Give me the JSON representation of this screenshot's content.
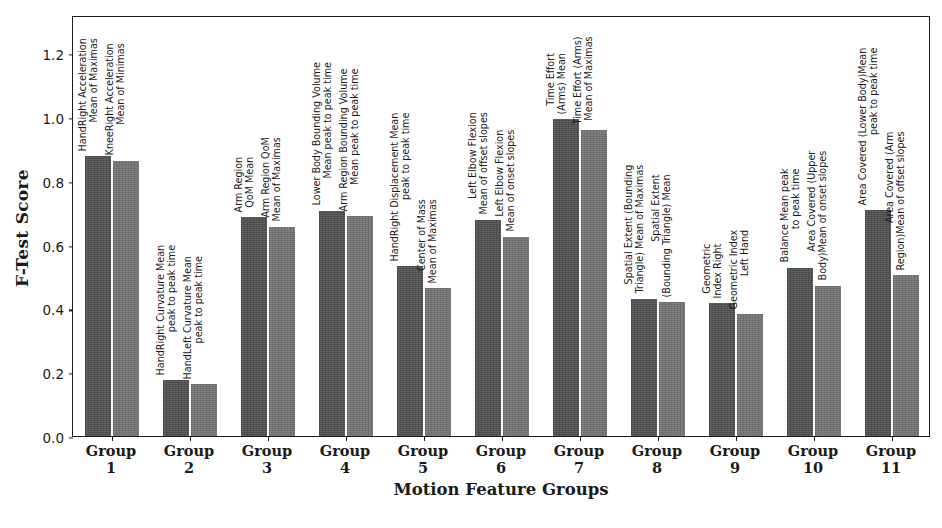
{
  "chart_data": {
    "type": "bar",
    "title": "",
    "xlabel": "Motion Feature Groups",
    "ylabel": "F-Test Score",
    "ylim": [
      0.0,
      1.32
    ],
    "yticks": [
      "0.0",
      "0.2",
      "0.4",
      "0.6",
      "0.8",
      "1.0",
      "1.2"
    ],
    "ytick_values": [
      0.0,
      0.2,
      0.4,
      0.6,
      0.8,
      1.0,
      1.2
    ],
    "grid": false,
    "legend": "none",
    "categories": [
      "Group 1",
      "Group 2",
      "Group 3",
      "Group 4",
      "Group 5",
      "Group 6",
      "Group 7",
      "Group 8",
      "Group 9",
      "Group 10",
      "Group 11"
    ],
    "series": [
      {
        "name": "First feature in group",
        "color": "#4a4a4a",
        "values": [
          0.877,
          0.175,
          0.686,
          0.706,
          0.533,
          0.678,
          0.993,
          0.43,
          0.417,
          0.528,
          0.708
        ]
      },
      {
        "name": "Second feature in group",
        "color": "#6e6e6e",
        "values": [
          0.863,
          0.163,
          0.656,
          0.69,
          0.463,
          0.625,
          0.96,
          0.42,
          0.381,
          0.471,
          0.505
        ]
      }
    ],
    "bar_annotations": [
      [
        "HandRight Acceleration\nMean of Maximas",
        "KneeRight Acceleration\nMean of Minimas"
      ],
      [
        "HandRight Curvature Mean\npeak to peak time",
        "HandLeft Curvature Mean\npeak to peak time"
      ],
      [
        "Arm Region\nQoM Mean",
        "Arm Region QoM\nMean of Maximas"
      ],
      [
        "Lower Body Bounding Volume\nMean peak to peak time",
        "Arm Region Bounding Volume\nMean peak to peak time"
      ],
      [
        "HandRight Displacement Mean\npeak to peak time",
        "Center of Mass\nMean of Maximas"
      ],
      [
        "Left Elbow Flexion\nMean of offset slopes",
        "Left Elbow Flexion\nMean of onset slopes"
      ],
      [
        "Time Effort\n(Arms) Mean",
        "Time Effort (Arms)\nMean of Maximas"
      ],
      [
        "Spatial Extent (Bounding\nTriangle) Mean of Maximas",
        "Spatial Extent\n(Bounding Triangle) Mean"
      ],
      [
        "Geometric\nIndex Right",
        "Geometric Index\nLeft Hand"
      ],
      [
        "Balance Mean peak\nto peak time",
        "Area Covered (Upper\nBody)Mean of onset slopes"
      ],
      [
        "Area Covered (Lower Body)Mean\npeak to peak time",
        "Area Covered (Arm\nRegion)Mean of offset slopes"
      ]
    ]
  }
}
